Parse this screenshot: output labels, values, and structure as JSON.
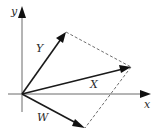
{
  "diagram": {
    "type": "vector-addition",
    "axes": {
      "x_label": "x",
      "y_label": "y",
      "origin": [
        22,
        94
      ]
    },
    "vectors": [
      {
        "name": "Y",
        "label": "Y",
        "tip": [
          66,
          32
        ],
        "label_pos": [
          36,
          52
        ]
      },
      {
        "name": "X",
        "label": "X",
        "tip": [
          131,
          67
        ],
        "label_pos": [
          90,
          88
        ]
      },
      {
        "name": "W",
        "label": "W",
        "tip": [
          85,
          128
        ],
        "label_pos": [
          37,
          121
        ]
      }
    ],
    "dashed_edges": [
      {
        "from": "Y",
        "to": "X"
      },
      {
        "from": "X",
        "to": "W"
      }
    ],
    "colors": {
      "axis": "#6a6a6a",
      "vector": "#1a1a1a",
      "dashed": "#4a4a4a",
      "background": "#ffffff"
    }
  }
}
